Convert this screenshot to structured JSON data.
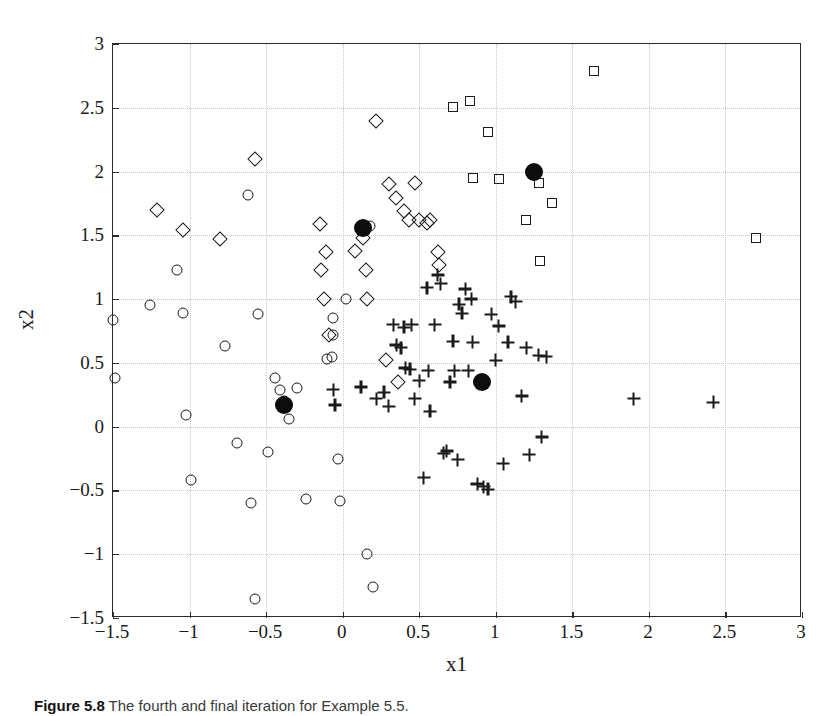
{
  "figure": {
    "caption_label": "Figure 5.8",
    "caption_text": "The fourth and final iteration for Example 5.5."
  },
  "chart_data": {
    "type": "scatter",
    "title": "",
    "xlabel": "x1",
    "ylabel": "x2",
    "xlim": [
      -1.5,
      3
    ],
    "ylim": [
      -1.5,
      3
    ],
    "xticks": [
      "-1.5",
      "-1",
      "-0.5",
      "0",
      "0.5",
      "1",
      "1.5",
      "2",
      "2.5",
      "3"
    ],
    "xtick_values": [
      -1.5,
      -1,
      -0.5,
      0,
      0.5,
      1,
      1.5,
      2,
      2.5,
      3
    ],
    "yticks": [
      "-1.5",
      "-1",
      "-0.5",
      "0",
      "0.5",
      "1",
      "1.5",
      "2",
      "2.5",
      "3"
    ],
    "ytick_values": [
      -1.5,
      -1,
      -0.5,
      0,
      0.5,
      1,
      1.5,
      2,
      2.5,
      3
    ],
    "grid": true,
    "legend": "none",
    "marker_colors": {
      "outline": "#1a1a1a",
      "centroid": "#0d0d0d"
    },
    "series": [
      {
        "name": "Cluster 1",
        "marker": "circle",
        "points": [
          [
            -1.5,
            0.84
          ],
          [
            -1.49,
            0.38
          ],
          [
            -1.26,
            0.95
          ],
          [
            -1.08,
            1.23
          ],
          [
            -1.04,
            0.89
          ],
          [
            -1.02,
            0.09
          ],
          [
            -0.99,
            -0.42
          ],
          [
            -0.77,
            0.63
          ],
          [
            -0.69,
            -0.13
          ],
          [
            -0.62,
            1.82
          ],
          [
            -0.6,
            -0.6
          ],
          [
            -0.57,
            -1.35
          ],
          [
            -0.55,
            0.88
          ],
          [
            -0.49,
            -0.2
          ],
          [
            -0.44,
            0.38
          ],
          [
            -0.41,
            0.29
          ],
          [
            -0.38,
            0.2
          ],
          [
            -0.35,
            0.06
          ],
          [
            -0.3,
            0.3
          ],
          [
            -0.24,
            -0.57
          ],
          [
            -0.1,
            0.53
          ],
          [
            -0.07,
            0.55
          ],
          [
            -0.06,
            0.72
          ],
          [
            -0.06,
            0.85
          ],
          [
            -0.03,
            -0.25
          ],
          [
            -0.02,
            -0.58
          ],
          [
            0.02,
            1.0
          ],
          [
            0.16,
            -1.0
          ],
          [
            0.2,
            -1.26
          ],
          [
            0.18,
            1.57
          ]
        ]
      },
      {
        "name": "Cluster 2",
        "marker": "diamond",
        "points": [
          [
            -1.21,
            1.7
          ],
          [
            -1.04,
            1.54
          ],
          [
            -0.8,
            1.47
          ],
          [
            -0.57,
            2.1
          ],
          [
            -0.15,
            1.59
          ],
          [
            -0.11,
            1.37
          ],
          [
            -0.14,
            1.23
          ],
          [
            -0.12,
            1.0
          ],
          [
            -0.09,
            0.72
          ],
          [
            0.08,
            1.38
          ],
          [
            0.13,
            1.48
          ],
          [
            0.15,
            1.23
          ],
          [
            0.16,
            1.0
          ],
          [
            0.22,
            2.4
          ],
          [
            0.3,
            1.9
          ],
          [
            0.35,
            1.79
          ],
          [
            0.4,
            1.69
          ],
          [
            0.43,
            1.62
          ],
          [
            0.47,
            1.91
          ],
          [
            0.5,
            1.62
          ],
          [
            0.55,
            1.6
          ],
          [
            0.57,
            1.62
          ],
          [
            0.62,
            1.37
          ],
          [
            0.63,
            1.27
          ],
          [
            0.36,
            0.35
          ],
          [
            0.28,
            0.52
          ]
        ]
      },
      {
        "name": "Cluster 3",
        "marker": "plus",
        "points": [
          [
            -0.06,
            0.29
          ],
          [
            -0.05,
            0.17
          ],
          [
            0.12,
            0.31
          ],
          [
            0.22,
            0.22
          ],
          [
            0.27,
            0.27
          ],
          [
            0.3,
            0.16
          ],
          [
            0.33,
            0.8
          ],
          [
            0.35,
            0.64
          ],
          [
            0.38,
            0.62
          ],
          [
            0.4,
            0.78
          ],
          [
            0.41,
            0.46
          ],
          [
            0.44,
            0.45
          ],
          [
            0.45,
            0.8
          ],
          [
            0.47,
            0.22
          ],
          [
            0.5,
            0.36
          ],
          [
            0.53,
            -0.4
          ],
          [
            0.55,
            1.09
          ],
          [
            0.56,
            0.44
          ],
          [
            0.57,
            0.12
          ],
          [
            0.6,
            0.8
          ],
          [
            0.62,
            1.19
          ],
          [
            0.64,
            1.12
          ],
          [
            0.66,
            -0.21
          ],
          [
            0.68,
            -0.19
          ],
          [
            0.7,
            0.35
          ],
          [
            0.72,
            0.67
          ],
          [
            0.73,
            0.44
          ],
          [
            0.75,
            -0.26
          ],
          [
            0.76,
            0.96
          ],
          [
            0.78,
            0.89
          ],
          [
            0.8,
            1.08
          ],
          [
            0.82,
            0.44
          ],
          [
            0.84,
            1.0
          ],
          [
            0.85,
            0.66
          ],
          [
            0.88,
            -0.45
          ],
          [
            0.9,
            0.35
          ],
          [
            0.92,
            -0.47
          ],
          [
            0.95,
            -0.49
          ],
          [
            0.97,
            0.88
          ],
          [
            1.0,
            0.52
          ],
          [
            1.02,
            0.79
          ],
          [
            1.05,
            -0.29
          ],
          [
            1.08,
            0.66
          ],
          [
            1.1,
            1.02
          ],
          [
            1.13,
            0.98
          ],
          [
            1.17,
            0.24
          ],
          [
            1.2,
            0.62
          ],
          [
            1.22,
            -0.22
          ],
          [
            1.28,
            0.56
          ],
          [
            1.3,
            -0.08
          ],
          [
            1.33,
            0.55
          ],
          [
            1.9,
            0.22
          ],
          [
            2.42,
            0.19
          ]
        ]
      },
      {
        "name": "Cluster 4",
        "marker": "square",
        "points": [
          [
            0.72,
            2.51
          ],
          [
            0.83,
            2.55
          ],
          [
            0.95,
            2.31
          ],
          [
            0.85,
            1.95
          ],
          [
            1.02,
            1.94
          ],
          [
            1.28,
            1.91
          ],
          [
            1.37,
            1.75
          ],
          [
            1.2,
            1.62
          ],
          [
            1.29,
            1.3
          ],
          [
            1.64,
            2.79
          ],
          [
            2.7,
            1.48
          ]
        ]
      }
    ],
    "centroids": {
      "name": "Cluster centers",
      "marker": "filled-circle",
      "points": [
        [
          -0.38,
          0.17
        ],
        [
          0.13,
          1.56
        ],
        [
          0.91,
          0.35
        ],
        [
          1.25,
          2.0
        ]
      ]
    }
  }
}
